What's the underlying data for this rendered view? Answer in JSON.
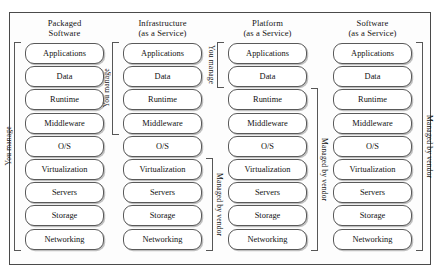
{
  "diagram": {
    "layers": [
      "Applications",
      "Data",
      "Runtime",
      "Middleware",
      "O/S",
      "Virtualization",
      "Servers",
      "Storage",
      "Networking"
    ],
    "labels": {
      "you_manage": "You manage",
      "managed_by_vendor": "Managed by vendor"
    },
    "colors": {
      "box_border": "#595959",
      "frame_border": "#4a4a4a",
      "box_fill": "#ffffff",
      "text": "#111111",
      "background": "#ffffff"
    },
    "columns": [
      {
        "id": "packaged-software",
        "header_line1": "Packaged",
        "header_line2": "Software",
        "layers": [
          "Applications",
          "Data",
          "Runtime",
          "Middleware",
          "O/S",
          "Virtualization",
          "Servers",
          "Storage",
          "Networking"
        ],
        "brackets": [
          {
            "side": "left",
            "label": "You manage",
            "from_layer": "Applications",
            "to_layer": "Networking",
            "from_index": 0,
            "to_index": 8,
            "text_direction": "up"
          }
        ]
      },
      {
        "id": "infrastructure-as-a-service",
        "header_line1": "Infrastructure",
        "header_line2": "(as a Service)",
        "layers": [
          "Applications",
          "Data",
          "Runtime",
          "Middleware",
          "O/S",
          "Virtualization",
          "Servers",
          "Storage",
          "Networking"
        ],
        "brackets": [
          {
            "side": "left",
            "label": "You manage",
            "from_layer": "Applications",
            "to_layer": "Middleware",
            "from_index": 0,
            "to_index": 3,
            "text_direction": "up"
          },
          {
            "side": "right",
            "label": "Managed by vendor",
            "from_layer": "Virtualization",
            "to_layer": "Networking",
            "from_index": 5,
            "to_index": 8,
            "text_direction": "down"
          }
        ]
      },
      {
        "id": "platform-as-a-service",
        "header_line1": "Platform",
        "header_line2": "(as a Service)",
        "layers": [
          "Applications",
          "Data",
          "Runtime",
          "Middleware",
          "O/S",
          "Virtualization",
          "Servers",
          "Storage",
          "Networking"
        ],
        "brackets": [
          {
            "side": "left",
            "label": "You manage",
            "from_layer": "Applications",
            "to_layer": "Data",
            "from_index": 0,
            "to_index": 1,
            "text_direction": "down"
          },
          {
            "side": "right",
            "label": "Managed by vendor",
            "from_layer": "Runtime",
            "to_layer": "Networking",
            "from_index": 2,
            "to_index": 8,
            "text_direction": "down"
          }
        ]
      },
      {
        "id": "software-as-a-service",
        "header_line1": "Software",
        "header_line2": "(as a Service)",
        "layers": [
          "Applications",
          "Data",
          "Runtime",
          "Middleware",
          "O/S",
          "Virtualization",
          "Servers",
          "Storage",
          "Networking"
        ],
        "brackets": [
          {
            "side": "right",
            "label": "Managed by vendor",
            "from_layer": "Applications",
            "to_layer": "Networking",
            "from_index": 0,
            "to_index": 8,
            "text_direction": "down"
          }
        ]
      }
    ]
  }
}
